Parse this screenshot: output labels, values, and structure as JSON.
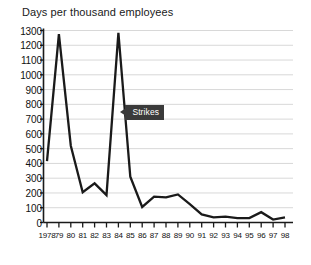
{
  "chart": {
    "title": "Days per thousand employees",
    "annotation": {
      "label": "Strikes",
      "icon": "left-arrow-icon"
    }
  },
  "chart_data": {
    "type": "line",
    "title": "Days per thousand employees",
    "xlabel": "",
    "ylabel": "Days per thousand employees",
    "ylim": [
      0,
      1300
    ],
    "ytick_step": 100,
    "yticks": [
      0,
      100,
      200,
      300,
      400,
      500,
      600,
      700,
      800,
      900,
      1000,
      1100,
      1200,
      1300
    ],
    "ytick_labels": [
      "0",
      "100",
      "200",
      "300",
      "400",
      "500",
      "600",
      "700",
      "800",
      "900",
      "1000",
      "1100",
      "1200",
      "1300"
    ],
    "grid": true,
    "legend": false,
    "categories": [
      "1978",
      "79",
      "80",
      "81",
      "82",
      "83",
      "84",
      "85",
      "86",
      "87",
      "88",
      "89",
      "90",
      "91",
      "92",
      "93",
      "94",
      "95",
      "96",
      "97",
      "98"
    ],
    "x": [
      1978,
      1979,
      1980,
      1981,
      1982,
      1983,
      1984,
      1985,
      1986,
      1987,
      1988,
      1989,
      1990,
      1991,
      1992,
      1993,
      1994,
      1995,
      1996,
      1997,
      1998
    ],
    "values": [
      415,
      1275,
      520,
      205,
      265,
      185,
      1285,
      310,
      105,
      175,
      170,
      190,
      125,
      55,
      35,
      40,
      30,
      30,
      70,
      20,
      35
    ],
    "series": [
      {
        "name": "Strikes",
        "color": "#1a1a1a",
        "values": [
          415,
          1275,
          520,
          205,
          265,
          185,
          1285,
          310,
          105,
          175,
          170,
          190,
          125,
          55,
          35,
          40,
          30,
          30,
          70,
          20,
          35
        ]
      }
    ],
    "annotations": [
      {
        "text": "Strikes",
        "x": 1984,
        "y": 745
      }
    ]
  },
  "colors": {
    "line": "#1a1a1a",
    "grid": "#d8d8d8",
    "axis": "#1a1a1a",
    "callout_bg": "#3a3a3a",
    "callout_text": "#ffffff",
    "background": "#ffffff"
  }
}
